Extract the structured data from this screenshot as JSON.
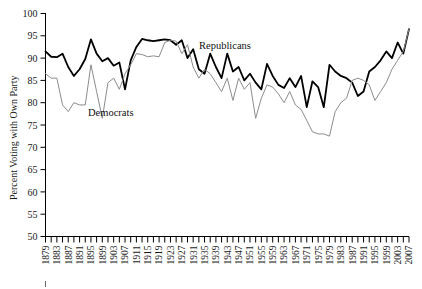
{
  "chart_data": {
    "type": "line",
    "title": "",
    "xlabel": "",
    "ylabel": "Percent Voting with Own Party",
    "ylim": [
      50,
      100
    ],
    "ytick_step": 5,
    "yticks": [
      50,
      55,
      60,
      65,
      70,
      75,
      80,
      85,
      90,
      95,
      100
    ],
    "xlim": [
      1879,
      2007
    ],
    "xtick_step": 2,
    "xlabel_step": 4,
    "xticks": [
      1879,
      1881,
      1883,
      1885,
      1887,
      1889,
      1891,
      1893,
      1895,
      1897,
      1899,
      1901,
      1903,
      1905,
      1907,
      1909,
      1911,
      1913,
      1915,
      1917,
      1919,
      1921,
      1923,
      1925,
      1927,
      1929,
      1931,
      1933,
      1935,
      1937,
      1939,
      1941,
      1943,
      1945,
      1947,
      1949,
      1951,
      1953,
      1955,
      1957,
      1959,
      1961,
      1963,
      1965,
      1967,
      1969,
      1971,
      1973,
      1975,
      1977,
      1979,
      1981,
      1983,
      1985,
      1987,
      1989,
      1991,
      1993,
      1995,
      1997,
      1999,
      2001,
      2003,
      2005,
      2007
    ],
    "xtick_labels": [
      "1879",
      "1883",
      "1887",
      "1891",
      "1895",
      "1899",
      "1903",
      "1907",
      "1911",
      "1915",
      "1919",
      "1923",
      "1927",
      "1931",
      "1935",
      "1939",
      "1943",
      "1947",
      "1951",
      "1955",
      "1959",
      "1963",
      "1967",
      "1971",
      "1975",
      "1979",
      "1983",
      "1987",
      "1991",
      "1995",
      "1999",
      "2003",
      "2007"
    ],
    "grid": false,
    "legend_position": "inline-annotation",
    "x": [
      1879,
      1881,
      1883,
      1885,
      1887,
      1889,
      1891,
      1893,
      1895,
      1897,
      1899,
      1901,
      1903,
      1905,
      1907,
      1909,
      1911,
      1913,
      1915,
      1917,
      1919,
      1921,
      1923,
      1925,
      1927,
      1929,
      1931,
      1933,
      1935,
      1937,
      1939,
      1941,
      1943,
      1945,
      1947,
      1949,
      1951,
      1953,
      1955,
      1957,
      1959,
      1961,
      1963,
      1965,
      1967,
      1969,
      1971,
      1973,
      1975,
      1977,
      1979,
      1981,
      1983,
      1985,
      1987,
      1989,
      1991,
      1993,
      1995,
      1997,
      1999,
      2001,
      2003,
      2005,
      2007
    ],
    "series": [
      {
        "name": "Republicans",
        "color": "#000000",
        "line_width": 1.8,
        "values": [
          91.5,
          90.3,
          90.2,
          91.0,
          88.0,
          86.0,
          87.5,
          89.8,
          94.2,
          91.0,
          89.3,
          90.0,
          88.3,
          89.0,
          83.0,
          89.5,
          92.5,
          94.3,
          94.0,
          93.8,
          94.0,
          94.2,
          94.0,
          93.0,
          94.0,
          90.0,
          92.0,
          87.5,
          86.5,
          91.0,
          88.0,
          85.5,
          91.0,
          87.0,
          88.0,
          85.0,
          86.5,
          84.5,
          83.0,
          88.7,
          86.0,
          84.0,
          83.3,
          85.5,
          83.5,
          86.0,
          79.0,
          84.8,
          83.5,
          79.0,
          88.5,
          87.0,
          86.0,
          85.5,
          84.5,
          81.5,
          82.5,
          87.0,
          88.0,
          89.5,
          91.5,
          90.0,
          93.5,
          91.0,
          96.5
        ]
      },
      {
        "name": "Democrats",
        "color": "#8c8c8c",
        "line_width": 1.0,
        "values": [
          86.5,
          85.5,
          85.5,
          79.5,
          78.0,
          80.0,
          79.5,
          79.5,
          88.5,
          82.5,
          76.5,
          84.5,
          85.5,
          83.0,
          86.5,
          88.5,
          91.0,
          90.8,
          90.3,
          90.5,
          90.3,
          93.5,
          94.0,
          93.8,
          91.0,
          93.0,
          88.0,
          85.5,
          87.5,
          86.5,
          84.5,
          82.5,
          85.5,
          80.5,
          85.5,
          83.0,
          84.5,
          76.5,
          81.0,
          84.0,
          83.5,
          82.0,
          80.0,
          82.5,
          79.5,
          78.5,
          76.0,
          73.5,
          73.0,
          73.0,
          72.5,
          78.0,
          80.0,
          81.0,
          85.0,
          85.5,
          85.0,
          84.0,
          80.5,
          82.5,
          84.5,
          87.5,
          89.5,
          91.5,
          96.5
        ]
      }
    ],
    "annotations": [
      {
        "text": "Democrats",
        "x_px": 88,
        "y_px": 116,
        "name": "democrats-series-label"
      },
      {
        "text": "Republicans",
        "x_px": 199,
        "y_px": 49,
        "name": "republicans-series-label"
      }
    ]
  }
}
